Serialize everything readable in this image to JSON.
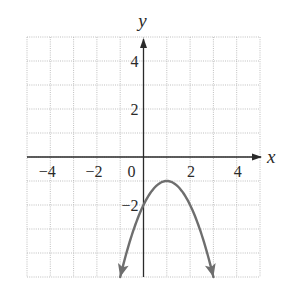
{
  "chart_data": {
    "type": "line",
    "title": "",
    "xlabel": "x",
    "ylabel": "y",
    "xlim": [
      -5,
      5
    ],
    "ylim": [
      -5,
      5
    ],
    "grid": true,
    "grid_step": 1,
    "x_ticks": [
      {
        "value": -4,
        "label": "−4"
      },
      {
        "value": -2,
        "label": "−2"
      },
      {
        "value": 0,
        "label": "0"
      },
      {
        "value": 2,
        "label": "2"
      },
      {
        "value": 4,
        "label": "4"
      }
    ],
    "y_ticks": [
      {
        "value": 4,
        "label": "4"
      },
      {
        "value": 2,
        "label": "2"
      },
      {
        "value": -2,
        "label": "−2"
      }
    ],
    "series": [
      {
        "name": "parabola",
        "equation": "y = -(x - 1)^2 - 1",
        "vertex": [
          1,
          -1
        ],
        "y_intercept": -2,
        "x_range": [
          -1,
          3
        ],
        "endpoints_arrows": true,
        "points": [
          [
            -1,
            -5
          ],
          [
            0,
            -2
          ],
          [
            1,
            -1
          ],
          [
            2,
            -2
          ],
          [
            3,
            -5
          ]
        ],
        "color": "#6e6e6e"
      }
    ],
    "colors": {
      "axis": "#2a2a2a",
      "grid": "#b8b8b8",
      "curve": "#6e6e6e"
    }
  }
}
